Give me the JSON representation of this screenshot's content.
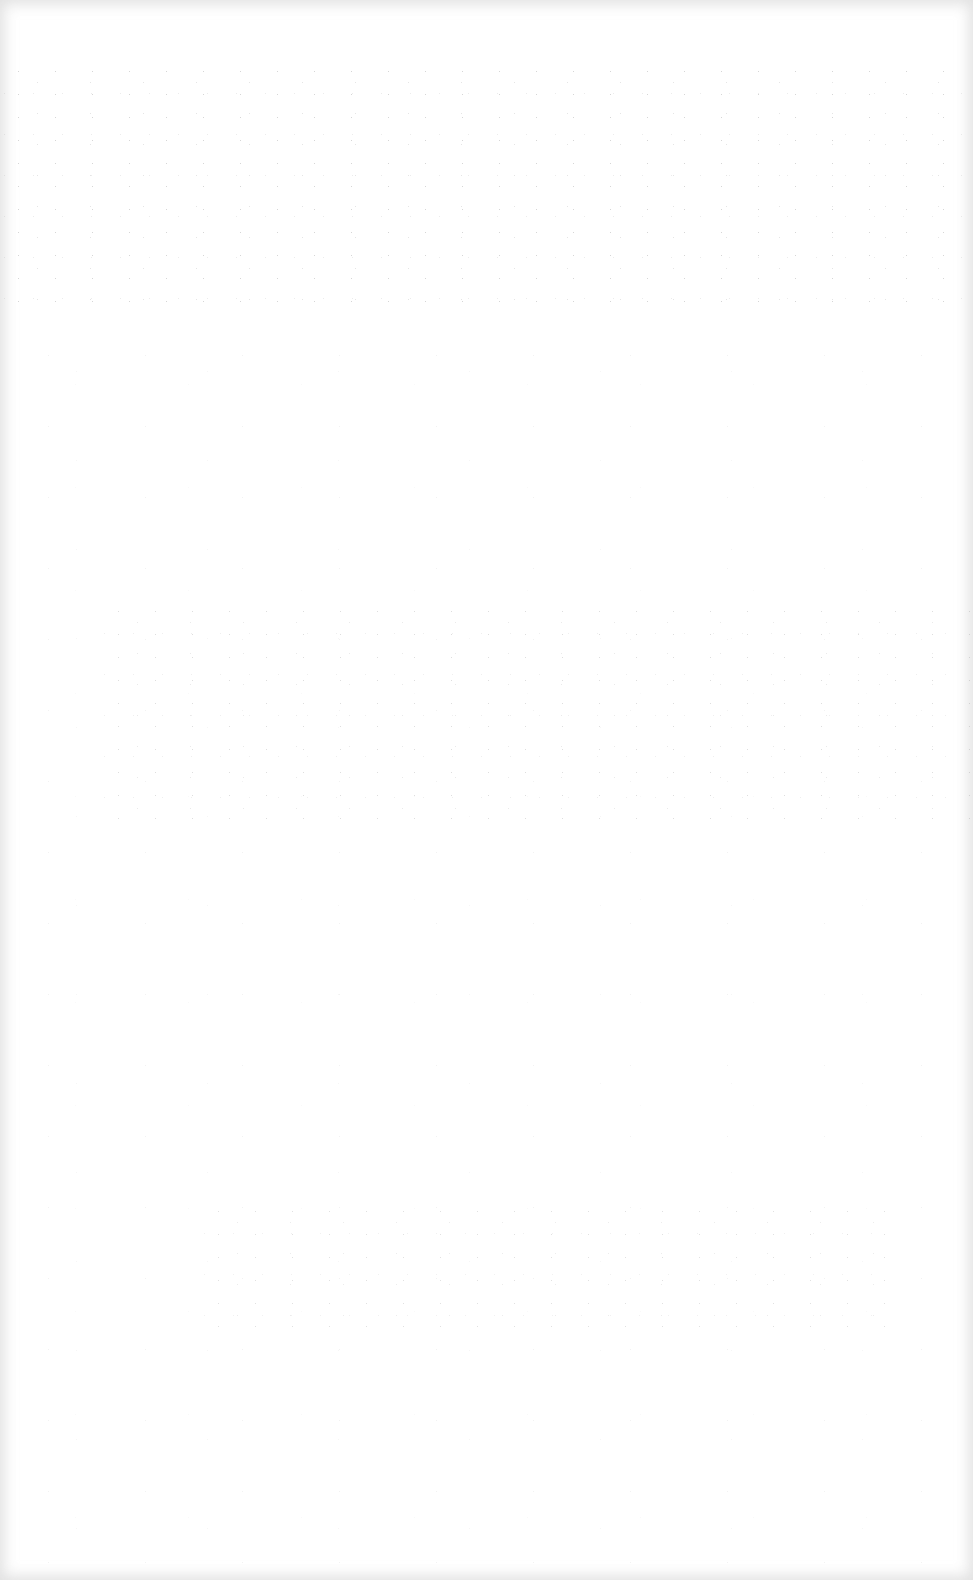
{
  "page": {
    "content": "",
    "background_color": "#ffffff",
    "edge_tint_color": "#c8c8c8"
  }
}
